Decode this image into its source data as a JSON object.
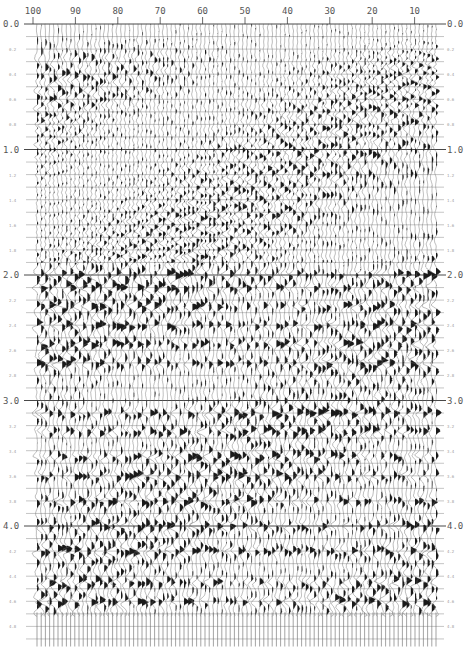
{
  "chart_data": {
    "type": "seismic-wiggle",
    "title": "",
    "xlabel": "Trace number",
    "ylabel": "Two-way time (s)",
    "x_axis": {
      "reversed": true,
      "range": [
        100,
        5
      ],
      "tick_labels": [
        "100",
        "90",
        "80",
        "70",
        "60",
        "50",
        "40",
        "30",
        "20",
        "10"
      ],
      "tick_values": [
        100,
        90,
        80,
        70,
        60,
        50,
        40,
        30,
        20,
        10
      ],
      "position": "top"
    },
    "y_axis": {
      "range": [
        0.0,
        5.0
      ],
      "major_tick_labels": [
        "0.0",
        "1.0",
        "2.0",
        "3.0",
        "4.0"
      ],
      "major_tick_values": [
        0.0,
        1.0,
        2.0,
        3.0,
        4.0
      ],
      "minor_tick_labels": [
        "0.2",
        "0.4",
        "0.6",
        "0.8",
        "1.2",
        "1.4",
        "1.6",
        "1.8",
        "2.2",
        "2.4",
        "2.6",
        "2.8",
        "3.2",
        "3.4",
        "3.6",
        "3.8",
        "4.2",
        "4.4",
        "4.6",
        "4.8"
      ],
      "minor_tick_values": [
        0.2,
        0.4,
        0.6,
        0.8,
        1.2,
        1.4,
        1.6,
        1.8,
        2.2,
        2.4,
        2.6,
        2.8,
        3.2,
        3.4,
        3.6,
        3.8,
        4.2,
        4.4,
        4.6,
        4.8
      ],
      "timing_line_interval_s": 0.1,
      "labels_both_sides": true
    },
    "num_traces": 96,
    "data_end_time_s": 4.72,
    "display": "variable-area wiggle, black fill positive",
    "strong_reflector_bands_s": [
      2.0,
      2.1,
      2.25,
      2.4,
      2.55,
      2.7,
      3.1,
      3.25,
      3.45,
      3.6,
      3.8,
      4.0,
      4.2,
      4.45,
      4.6
    ],
    "grid": true
  },
  "layout": {
    "plot_left_px": 33,
    "plot_right_px": 440,
    "plot_top_px": 24,
    "px_per_second": 125.5,
    "trace_spacing_px": 4.25,
    "line_color": "#6a6a6a",
    "fill_color": "#1a1a1a"
  }
}
